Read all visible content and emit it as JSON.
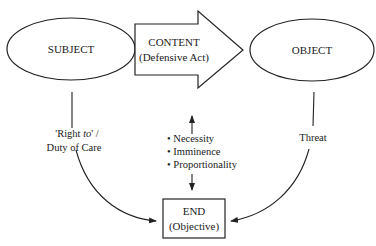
{
  "nodes": {
    "subject": {
      "label": "SUBJECT",
      "shape": "ellipse"
    },
    "content": {
      "label": "CONTENT",
      "sublabel": "(Defensive Act)",
      "shape": "block-arrow"
    },
    "object": {
      "label": "OBJECT",
      "shape": "ellipse"
    },
    "end": {
      "label": "END",
      "sublabel": "(Objective)",
      "shape": "rectangle"
    }
  },
  "edges": {
    "subject_to_end": {
      "label_line1_prefix": "'Right ",
      "label_line1_italic": "to",
      "label_line1_suffix": "' /",
      "label_line2": "Duty of Care"
    },
    "object_to_end": {
      "label": "Threat"
    },
    "content_end_link": {
      "bullets": [
        "• Necessity",
        "• Imminence",
        "• Proportionality"
      ]
    }
  }
}
